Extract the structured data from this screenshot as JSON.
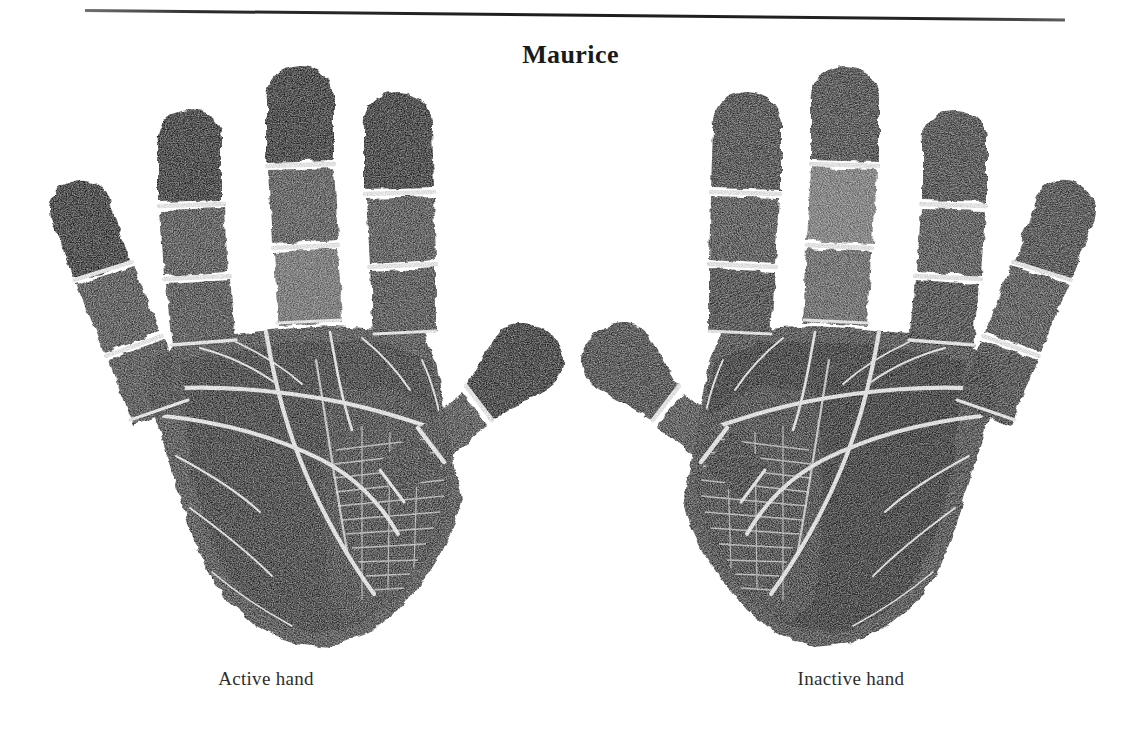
{
  "page": {
    "background_color": "#ffffff",
    "ink_color": "#1d1d1d",
    "rule_color": "#232323"
  },
  "header": {
    "rule": "horizontal-rule",
    "title": "Maurice"
  },
  "figure": {
    "type": "handprint-pair",
    "hands": [
      {
        "id": "active-hand",
        "caption": "Active hand",
        "side": "left",
        "orientation": "palm-print, thumb pointing right toward center",
        "tone": "dark",
        "digits": [
          "little finger",
          "ring finger",
          "middle finger",
          "index finger",
          "thumb"
        ]
      },
      {
        "id": "inactive-hand",
        "caption": "Inactive hand",
        "side": "right",
        "orientation": "palm-print, thumb pointing left toward center",
        "tone": "medium",
        "digits": [
          "thumb",
          "index finger",
          "middle finger",
          "ring finger",
          "little finger"
        ]
      }
    ],
    "features": [
      "fingertip pattern areas",
      "interphalangeal flexion creases",
      "distal transverse crease (heart line)",
      "proximal transverse crease (head line)",
      "thenar crease (life line)",
      "thenar eminence hatching"
    ]
  }
}
